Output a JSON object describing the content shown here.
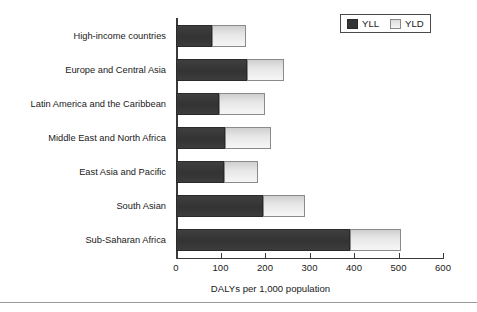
{
  "chart_data": {
    "type": "bar",
    "orientation": "horizontal",
    "stacked": true,
    "title": "",
    "xlabel": "DALYs per 1,000 population",
    "ylabel": "",
    "xlim": [
      0,
      600
    ],
    "xticks": [
      0,
      100,
      200,
      300,
      400,
      500,
      600
    ],
    "xtick_labels": [
      "0",
      "100",
      "200",
      "300",
      "400",
      "500",
      "600"
    ],
    "grid": false,
    "legend_position": "top-right",
    "categories": [
      "High-income countries",
      "Europe and Central Asia",
      "Latin America and the Caribbean",
      "Middle East and North Africa",
      "East Asia and Pacific",
      "South Asian",
      "Sub-Saharan Africa"
    ],
    "series": [
      {
        "name": "YLL",
        "color": "#353535",
        "values": [
          82,
          160,
          96,
          111,
          108,
          195,
          391
        ]
      },
      {
        "name": "YLD",
        "color": "#efefef",
        "values": [
          76,
          83,
          104,
          102,
          76,
          96,
          114
        ]
      }
    ],
    "totals": [
      158,
      243,
      200,
      213,
      184,
      291,
      505
    ]
  },
  "legend": {
    "items": [
      {
        "label": "YLL",
        "swatch": "dark-swatch-icon"
      },
      {
        "label": "YLD",
        "swatch": "light-swatch-icon"
      }
    ]
  },
  "axis": {
    "x_title": "DALYs per 1,000 population"
  }
}
